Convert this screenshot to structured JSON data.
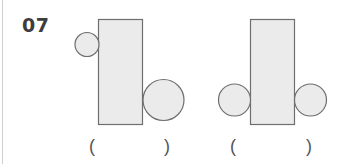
{
  "question": {
    "number": "07"
  },
  "colors": {
    "shape_fill": "#ebebeb",
    "shape_stroke": "#6e6e6e",
    "number_text": "#3d3d3d",
    "paren_text": "#555555"
  },
  "figures": [
    {
      "id": "figure-1",
      "rect": {
        "x": 98.5,
        "y": 19.5,
        "width": 44,
        "height": 105
      },
      "circles": [
        {
          "cx": 87,
          "cy": 44.5,
          "r": 12
        },
        {
          "cx": 163.5,
          "cy": 100,
          "r": 20.5
        }
      ],
      "answer_blank": {
        "open": "(",
        "close": ")"
      }
    },
    {
      "id": "figure-2",
      "rect": {
        "x": 250.5,
        "y": 19.5,
        "width": 44,
        "height": 105
      },
      "circles": [
        {
          "cx": 234.5,
          "cy": 100,
          "r": 16
        },
        {
          "cx": 310.5,
          "cy": 100,
          "r": 16
        }
      ],
      "answer_blank": {
        "open": "(",
        "close": ")"
      }
    }
  ]
}
